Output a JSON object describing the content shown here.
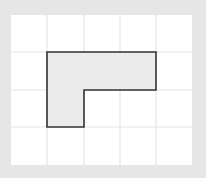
{
  "diagram": {
    "type": "grid-shape",
    "grid": {
      "columns": 5,
      "rows": 4,
      "background": "#ffffff",
      "line_color": "#e4e4e4",
      "frame_color": "#e6e6e6"
    },
    "shape": {
      "name": "L-shaped polygon",
      "fill": "#ebebeb",
      "stroke": "#333333",
      "cells": [
        [
          1,
          1
        ],
        [
          2,
          1
        ],
        [
          3,
          1
        ],
        [
          1,
          2
        ]
      ],
      "vertices_grid": [
        [
          1,
          1
        ],
        [
          4,
          1
        ],
        [
          4,
          2
        ],
        [
          2,
          2
        ],
        [
          2,
          3
        ],
        [
          1,
          3
        ]
      ]
    }
  }
}
